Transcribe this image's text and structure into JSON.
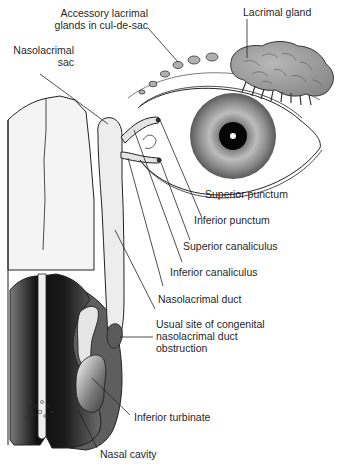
{
  "figure": {
    "labels": {
      "accessory_glands": [
        "Accessory lacrimal",
        "glands in cul-de-sac"
      ],
      "lacrimal_gland": "Lacrimal gland",
      "nasolacrimal_sac": [
        "Nasolacrimal",
        "sac"
      ],
      "superior_punctum": "Superior punctum",
      "inferior_punctum": "Inferior punctum",
      "superior_canaliculus": "Superior canaliculus",
      "inferior_canaliculus": "Inferior canaliculus",
      "nasolacrimal_duct": "Nasolacrimal duct",
      "obstruction_site": [
        "Usual site of congenital",
        "nasolacrimal duct",
        "obstruction"
      ],
      "inferior_turbinate": "Inferior turbinate",
      "nasal_cavity": "Nasal cavity"
    },
    "colors": {
      "line": "#222222",
      "duct_fill": "#ececec",
      "gland_fill": "#9a9a9a",
      "iris_outer": "#5a5a5a",
      "iris_inner": "#b5b5b5",
      "pupil": "#000000",
      "cavity_dark": "#111111",
      "cavity_mid": "#5c5c5c",
      "bone_light": "#f2f2f2"
    }
  }
}
